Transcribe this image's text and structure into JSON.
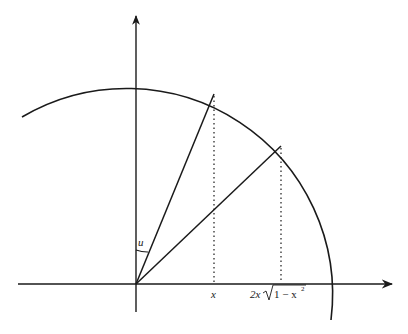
{
  "diagram": {
    "labels": {
      "angle": "u",
      "x_tick_1": "x",
      "x_tick_2_prefix": "2x",
      "x_tick_2_radicand": "1 − x",
      "x_tick_2_exponent": "2"
    },
    "colors": {
      "stroke": "#1a1a1a",
      "background": "#ffffff"
    }
  }
}
